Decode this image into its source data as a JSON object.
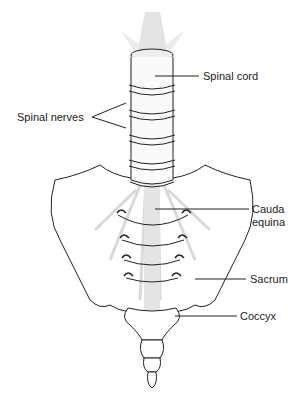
{
  "figure": {
    "type": "anatomical illustration"
  },
  "labels": {
    "spinal_cord": "Spinal cord",
    "spinal_nerves": "Spinal nerves",
    "cauda_equina_line1": "Cauda",
    "cauda_equina_line2": "equina",
    "sacrum": "Sacrum",
    "coccyx": "Coccyx"
  },
  "colors": {
    "line": "#222222",
    "nerve_shade": "#d9d9d9",
    "background": "#ffffff"
  }
}
